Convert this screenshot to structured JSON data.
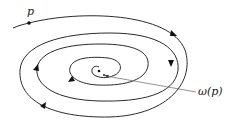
{
  "diagram": {
    "title": "",
    "labels": {
      "start_point": "p",
      "limit_point": "ω(p)"
    },
    "colors": {
      "stroke": "#2a2a2a",
      "leader": "#777777",
      "background": "#ffffff"
    },
    "nodes": [
      {
        "id": "p",
        "label": "p",
        "x": 29,
        "y": 23
      },
      {
        "id": "omega",
        "label": "ω(p)",
        "x": 99,
        "y": 71
      }
    ],
    "arrows_direction": "clockwise-inward"
  }
}
